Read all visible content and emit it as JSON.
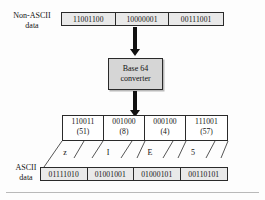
{
  "figure": {
    "labels": {
      "non_ascii_line1": "Non-ASCII",
      "non_ascii_line2": "data",
      "ascii_line1": "ASCII",
      "ascii_line2": "data"
    },
    "converter": {
      "line1": "Base 64",
      "line2": "converter"
    },
    "input_bytes": [
      "11001100",
      "10000001",
      "00111001"
    ],
    "groups": [
      {
        "bits": "110011",
        "decimal": "(51)",
        "char": "z"
      },
      {
        "bits": "001000",
        "decimal": "(8)",
        "char": "I"
      },
      {
        "bits": "000100",
        "decimal": "(4)",
        "char": "E"
      },
      {
        "bits": "111001",
        "decimal": "(57)",
        "char": "5"
      }
    ],
    "output_bytes": [
      "01111010",
      "01001001",
      "01000101",
      "00110101"
    ],
    "colors": {
      "stroke": "#2a2a2a",
      "strip_fill": "#e9e9e9",
      "converter_fill": "#d6d6d6",
      "arrow": "#111111",
      "rule": "#b9b9b9"
    }
  }
}
